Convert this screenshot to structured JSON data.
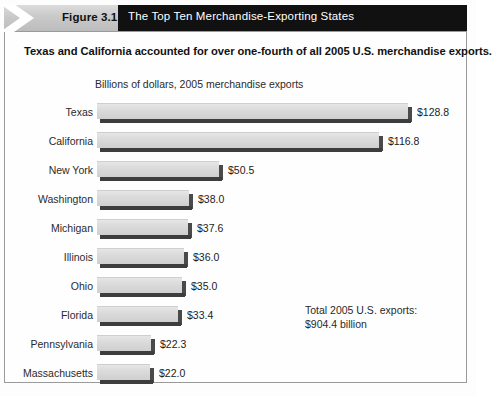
{
  "header": {
    "figure_tag": "Figure 3.1",
    "title": "The Top Ten Merchandise-Exporting States",
    "chevron_icon": "chevron-right-icon"
  },
  "subtitle": "Texas and California accounted for over one-fourth of all 2005 U.S. merchandise exports.",
  "annotation": {
    "line1": "Total 2005 U.S. exports:",
    "line2": "$904.4 billion"
  },
  "colors": {
    "header_bar": "#111111",
    "figure_tag_bg": "#c9c9c9",
    "bar_face": "#dcdcdc",
    "bar_shadow": "#3d3d3d",
    "frame_border": "#9a9a9a"
  },
  "chart_data": {
    "type": "bar",
    "orientation": "horizontal",
    "title": "The Top Ten Merchandise-Exporting States",
    "subtitle": "Texas and California accounted for over one-fourth of all 2005 U.S. merchandise exports.",
    "xlabel": "Billions of dollars, 2005 merchandise exports",
    "ylabel": "",
    "xlim": [
      0,
      128.8
    ],
    "grid": false,
    "legend": "none",
    "value_prefix": "$",
    "categories": [
      "Texas",
      "California",
      "New York",
      "Washington",
      "Michigan",
      "Illinois",
      "Ohio",
      "Florida",
      "Pennsylvania",
      "Massachusetts"
    ],
    "values": [
      128.8,
      116.8,
      50.5,
      38.0,
      37.6,
      36.0,
      35.0,
      33.4,
      22.3,
      22.0
    ],
    "labels": [
      "$128.8",
      "$116.8",
      "$50.5",
      "$38.0",
      "$37.6",
      "$36.0",
      "$35.0",
      "$33.4",
      "$22.3",
      "$22.0"
    ],
    "annotations": [
      "Total 2005 U.S. exports:",
      "$904.4 billion"
    ]
  }
}
